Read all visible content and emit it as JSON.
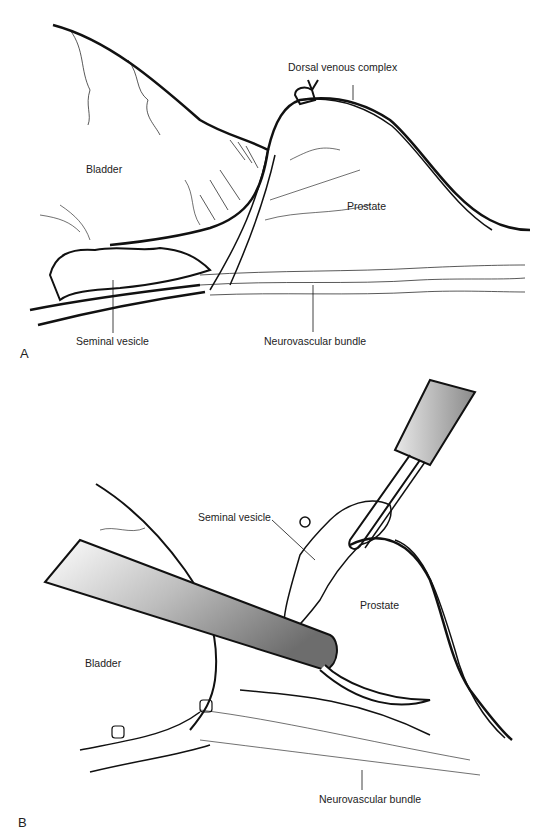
{
  "figure": {
    "panel_a": {
      "letter": "A",
      "labels": {
        "dorsal_venous_complex": "Dorsal venous complex",
        "bladder": "Bladder",
        "prostate": "Prostate",
        "seminal_vesicle": "Seminal vesicle",
        "neurovascular_bundle": "Neurovascular bundle"
      }
    },
    "panel_b": {
      "letter": "B",
      "labels": {
        "seminal_vesicle": "Seminal vesicle",
        "prostate": "Prostate",
        "bladder": "Bladder",
        "neurovascular_bundle": "Neurovascular bundle"
      }
    }
  }
}
